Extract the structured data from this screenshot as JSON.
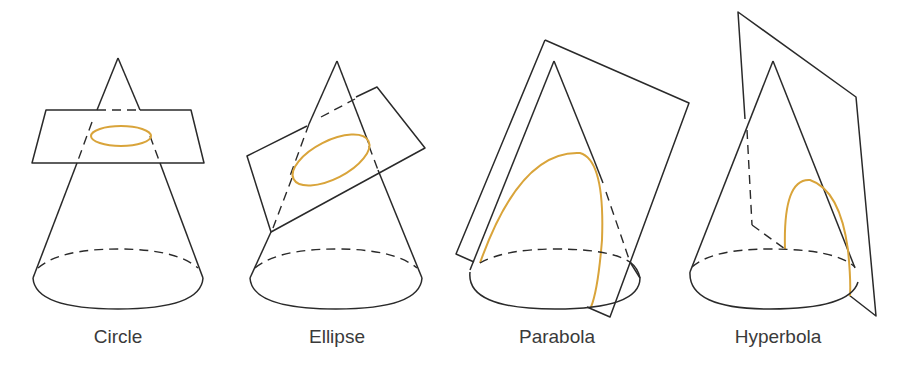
{
  "figure": {
    "colors": {
      "line": "#2a2a2a",
      "conic": "#d9a43a",
      "label": "#3a3a3a"
    },
    "panels": [
      {
        "id": "circle",
        "label": "Circle"
      },
      {
        "id": "ellipse",
        "label": "Ellipse"
      },
      {
        "id": "parabola",
        "label": "Parabola"
      },
      {
        "id": "hyperbola",
        "label": "Hyperbola"
      }
    ]
  }
}
